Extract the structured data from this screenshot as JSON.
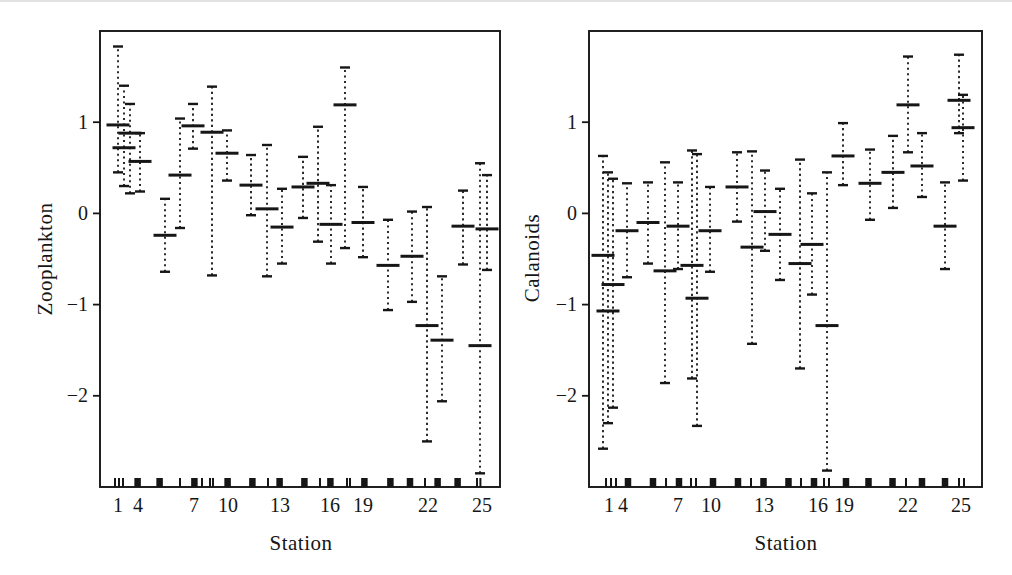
{
  "figure": {
    "ink_color": "#161616",
    "background_color": "#ffffff"
  },
  "chart_data": [
    {
      "type": "interval",
      "ylabel": "Zooplankton",
      "xlabel": "Station",
      "ylim": [
        -3,
        2
      ],
      "grid": false,
      "yticks": [
        {
          "v": 1,
          "label": "1"
        },
        {
          "v": 0,
          "label": "0"
        },
        {
          "v": -1,
          "label": "−1"
        },
        {
          "v": -2,
          "label": "−2"
        }
      ],
      "xticks": [
        {
          "f": 0.045,
          "label": "1"
        },
        {
          "f": 0.095,
          "label": "4"
        },
        {
          "f": 0.235,
          "label": "7"
        },
        {
          "f": 0.32,
          "label": "10"
        },
        {
          "f": 0.45,
          "label": "13"
        },
        {
          "f": 0.575,
          "label": "16"
        },
        {
          "f": 0.6575,
          "label": "19"
        },
        {
          "f": 0.82,
          "label": "22"
        },
        {
          "f": 0.955,
          "label": "25"
        }
      ],
      "stations": [
        {
          "x": 0.045,
          "mean": 0.97,
          "lo": 0.45,
          "hi": 1.83
        },
        {
          "x": 0.06,
          "mean": 0.72,
          "lo": 0.3,
          "hi": 1.4
        },
        {
          "x": 0.075,
          "mean": 0.88,
          "lo": 0.22,
          "hi": 1.2
        },
        {
          "x": 0.1,
          "mean": 0.57,
          "lo": 0.24,
          "hi": 0.88
        },
        {
          "x": 0.1625,
          "mean": -0.24,
          "lo": -0.64,
          "hi": 0.16
        },
        {
          "x": 0.2,
          "mean": 0.42,
          "lo": -0.16,
          "hi": 1.04
        },
        {
          "x": 0.2325,
          "mean": 0.96,
          "lo": 0.71,
          "hi": 1.2
        },
        {
          "x": 0.28,
          "mean": 0.89,
          "lo": -0.68,
          "hi": 1.39
        },
        {
          "x": 0.3175,
          "mean": 0.66,
          "lo": 0.36,
          "hi": 0.91
        },
        {
          "x": 0.3775,
          "mean": 0.31,
          "lo": -0.02,
          "hi": 0.64
        },
        {
          "x": 0.4175,
          "mean": 0.05,
          "lo": -0.69,
          "hi": 0.75
        },
        {
          "x": 0.455,
          "mean": -0.15,
          "lo": -0.55,
          "hi": 0.27
        },
        {
          "x": 0.5075,
          "mean": 0.29,
          "lo": -0.05,
          "hi": 0.62
        },
        {
          "x": 0.545,
          "mean": 0.33,
          "lo": -0.31,
          "hi": 0.95
        },
        {
          "x": 0.5775,
          "mean": -0.12,
          "lo": -0.55,
          "hi": 0.31
        },
        {
          "x": 0.6125,
          "mean": 1.19,
          "lo": -0.38,
          "hi": 1.6
        },
        {
          "x": 0.6575,
          "mean": -0.1,
          "lo": -0.48,
          "hi": 0.29
        },
        {
          "x": 0.72,
          "mean": -0.57,
          "lo": -1.06,
          "hi": -0.07
        },
        {
          "x": 0.78,
          "mean": -0.47,
          "lo": -0.97,
          "hi": 0.02
        },
        {
          "x": 0.8175,
          "mean": -1.23,
          "lo": -2.5,
          "hi": 0.07
        },
        {
          "x": 0.855,
          "mean": -1.39,
          "lo": -2.06,
          "hi": -0.69
        },
        {
          "x": 0.9075,
          "mean": -0.14,
          "lo": -0.56,
          "hi": 0.25
        },
        {
          "x": 0.95,
          "mean": -1.45,
          "lo": -2.85,
          "hi": 0.55
        },
        {
          "x": 0.9675,
          "mean": -0.17,
          "lo": -0.62,
          "hi": 0.42
        }
      ],
      "rug": [
        {
          "f": 0.0375,
          "w": "thin"
        },
        {
          "f": 0.0475,
          "w": "thin"
        },
        {
          "f": 0.0575,
          "w": "thin"
        },
        {
          "f": 0.094,
          "w": "thick"
        },
        {
          "f": 0.149,
          "w": "thick"
        },
        {
          "f": 0.2,
          "w": "thin"
        },
        {
          "f": 0.236,
          "w": "thick"
        },
        {
          "f": 0.255,
          "w": "thin"
        },
        {
          "f": 0.275,
          "w": "thin"
        },
        {
          "f": 0.2825,
          "w": "thin"
        },
        {
          "f": 0.319,
          "w": "thick"
        },
        {
          "f": 0.381,
          "w": "thick"
        },
        {
          "f": 0.42,
          "w": "thin"
        },
        {
          "f": 0.449,
          "w": "thick"
        },
        {
          "f": 0.511,
          "w": "thick"
        },
        {
          "f": 0.55,
          "w": "thin"
        },
        {
          "f": 0.576,
          "w": "thick"
        },
        {
          "f": 0.6175,
          "w": "thin"
        },
        {
          "f": 0.625,
          "w": "thin"
        },
        {
          "f": 0.661,
          "w": "thick"
        },
        {
          "f": 0.726,
          "w": "thick"
        },
        {
          "f": 0.775,
          "w": "thick"
        },
        {
          "f": 0.8125,
          "w": "thin"
        },
        {
          "f": 0.844,
          "w": "thick"
        },
        {
          "f": 0.894,
          "w": "thick"
        },
        {
          "f": 0.9425,
          "w": "thin"
        },
        {
          "f": 0.951,
          "w": "thin"
        }
      ]
    },
    {
      "type": "interval",
      "ylabel": "Calanoids",
      "xlabel": "Station",
      "ylim": [
        -3,
        2
      ],
      "grid": false,
      "yticks": [
        {
          "v": 1,
          "label": "1"
        },
        {
          "v": 0,
          "label": "0"
        },
        {
          "v": -1,
          "label": "−1"
        },
        {
          "v": -2,
          "label": "−2"
        }
      ],
      "xticks": [
        {
          "f": 0.051,
          "label": "1"
        },
        {
          "f": 0.0865,
          "label": "4"
        },
        {
          "f": 0.2265,
          "label": "7"
        },
        {
          "f": 0.3104,
          "label": "10"
        },
        {
          "f": 0.4453,
          "label": "13"
        },
        {
          "f": 0.5827,
          "label": "16"
        },
        {
          "f": 0.649,
          "label": "19"
        },
        {
          "f": 0.8117,
          "label": "22"
        },
        {
          "f": 0.9466,
          "label": "25"
        }
      ],
      "stations": [
        {
          "x": 0.0356,
          "mean": -0.46,
          "lo": -2.58,
          "hi": 0.63
        },
        {
          "x": 0.0483,
          "mean": -1.07,
          "lo": -2.3,
          "hi": 0.45
        },
        {
          "x": 0.0611,
          "mean": -0.78,
          "lo": -2.13,
          "hi": 0.38
        },
        {
          "x": 0.0967,
          "mean": -0.19,
          "lo": -0.7,
          "hi": 0.33
        },
        {
          "x": 0.1501,
          "mean": -0.1,
          "lo": -0.55,
          "hi": 0.34
        },
        {
          "x": 0.1934,
          "mean": -0.63,
          "lo": -1.86,
          "hi": 0.56
        },
        {
          "x": 0.2265,
          "mean": -0.14,
          "lo": -0.61,
          "hi": 0.34
        },
        {
          "x": 0.2621,
          "mean": -0.57,
          "lo": -1.81,
          "hi": 0.69
        },
        {
          "x": 0.2748,
          "mean": -0.93,
          "lo": -2.33,
          "hi": 0.65
        },
        {
          "x": 0.3079,
          "mean": -0.19,
          "lo": -0.64,
          "hi": 0.29
        },
        {
          "x": 0.3766,
          "mean": 0.29,
          "lo": -0.09,
          "hi": 0.67
        },
        {
          "x": 0.4148,
          "mean": -0.37,
          "lo": -1.43,
          "hi": 0.68
        },
        {
          "x": 0.4478,
          "mean": 0.02,
          "lo": -0.41,
          "hi": 0.47
        },
        {
          "x": 0.486,
          "mean": -0.23,
          "lo": -0.73,
          "hi": 0.27
        },
        {
          "x": 0.5369,
          "mean": -0.55,
          "lo": -1.7,
          "hi": 0.59
        },
        {
          "x": 0.5674,
          "mean": -0.34,
          "lo": -0.89,
          "hi": 0.22
        },
        {
          "x": 0.6056,
          "mean": -1.23,
          "lo": -2.82,
          "hi": 0.45
        },
        {
          "x": 0.6463,
          "mean": 0.63,
          "lo": 0.31,
          "hi": 0.99
        },
        {
          "x": 0.715,
          "mean": 0.33,
          "lo": -0.07,
          "hi": 0.7
        },
        {
          "x": 0.7735,
          "mean": 0.45,
          "lo": 0.06,
          "hi": 0.85
        },
        {
          "x": 0.8117,
          "mean": 1.19,
          "lo": 0.67,
          "hi": 1.72
        },
        {
          "x": 0.8473,
          "mean": 0.52,
          "lo": 0.18,
          "hi": 0.88
        },
        {
          "x": 0.9059,
          "mean": -0.14,
          "lo": -0.61,
          "hi": 0.34
        },
        {
          "x": 0.9415,
          "mean": 1.24,
          "lo": 0.88,
          "hi": 1.74
        },
        {
          "x": 0.9517,
          "mean": 0.94,
          "lo": 0.36,
          "hi": 1.3
        }
      ],
      "rug": [
        {
          "f": 0.0433,
          "w": "thin"
        },
        {
          "f": 0.056,
          "w": "thin"
        },
        {
          "f": 0.0687,
          "w": "thin"
        },
        {
          "f": 0.0992,
          "w": "thick"
        },
        {
          "f": 0.1628,
          "w": "thick"
        },
        {
          "f": 0.196,
          "w": "thin"
        },
        {
          "f": 0.229,
          "w": "thick"
        },
        {
          "f": 0.2595,
          "w": "thin"
        },
        {
          "f": 0.2723,
          "w": "thin"
        },
        {
          "f": 0.3155,
          "w": "thick"
        },
        {
          "f": 0.3791,
          "w": "thick"
        },
        {
          "f": 0.4122,
          "w": "thin"
        },
        {
          "f": 0.444,
          "w": "thick"
        },
        {
          "f": 0.5076,
          "w": "thick"
        },
        {
          "f": 0.5394,
          "w": "thin"
        },
        {
          "f": 0.5725,
          "w": "thick"
        },
        {
          "f": 0.598,
          "w": "thin"
        },
        {
          "f": 0.6107,
          "w": "thin"
        },
        {
          "f": 0.6539,
          "w": "thick"
        },
        {
          "f": 0.7112,
          "w": "thick"
        },
        {
          "f": 0.7723,
          "w": "thick"
        },
        {
          "f": 0.8066,
          "w": "thin"
        },
        {
          "f": 0.8473,
          "w": "thick"
        },
        {
          "f": 0.9059,
          "w": "thick"
        },
        {
          "f": 0.9415,
          "w": "thin"
        },
        {
          "f": 0.9542,
          "w": "thin"
        }
      ]
    }
  ]
}
